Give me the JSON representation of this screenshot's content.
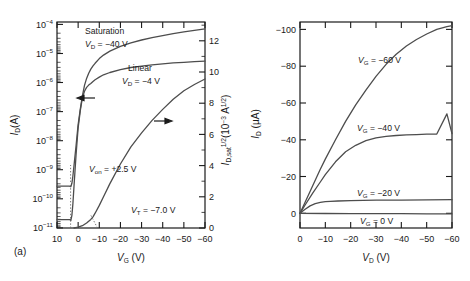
{
  "figure": {
    "panels": [
      {
        "caption": "(a)",
        "type": "transfer-characteristics"
      },
      {
        "caption": "(b)",
        "type": "output-characteristics"
      }
    ]
  },
  "panel_a": {
    "caption": "(a)",
    "xaxis": {
      "title_main": "V",
      "title_sub": "G",
      "title_unit": "(V)",
      "ticks": [
        "10",
        "0",
        "−10",
        "−20",
        "−30",
        "−40",
        "−50",
        "−60"
      ],
      "values": [
        10,
        0,
        -10,
        -20,
        -30,
        -40,
        -50,
        -60
      ],
      "range": [
        10,
        -60
      ]
    },
    "yaxis_left": {
      "title_main": "I",
      "title_sub": "D",
      "title_unit": "(A)",
      "ticks": [
        "10−4",
        "10−5",
        "10−6",
        "10−7",
        "10−8",
        "10−9",
        "10−10",
        "10−11"
      ],
      "tick_bases": [
        "10",
        "10",
        "10",
        "10",
        "10",
        "10",
        "10",
        "10"
      ],
      "tick_exps": [
        "−4",
        "−5",
        "−6",
        "−7",
        "−8",
        "−9",
        "−10",
        "−11"
      ],
      "exponents": [
        -4,
        -5,
        -6,
        -7,
        -8,
        -9,
        -10,
        -11
      ],
      "scale": "log",
      "range": [
        -4,
        -11
      ]
    },
    "yaxis_right": {
      "title_main": "I",
      "title_sub": "D,sat",
      "title_exp": "1/2",
      "title_unit_base": "(10",
      "title_unit_exp": "−3",
      "title_unit_mid": " A",
      "title_unit_exp2": "1/2",
      "title_unit_close": ")",
      "ticks": [
        "0",
        "2",
        "4",
        "6",
        "8",
        "10",
        "12"
      ],
      "values": [
        0,
        2,
        4,
        6,
        8,
        10,
        12
      ],
      "range": [
        0,
        13.2
      ]
    },
    "annotations": [
      {
        "name": "saturation-label",
        "line1": "Saturation",
        "sym": "V",
        "sub": "D",
        "eq": " = −40 V"
      },
      {
        "name": "linear-label",
        "line1": "Linear",
        "sym": "V",
        "sub": "D",
        "eq": " = −4 V"
      },
      {
        "name": "von-label",
        "sym": "V",
        "sub": "on",
        "eq": " = +2.5 V"
      },
      {
        "name": "vt-label",
        "sym": "V",
        "sub": "T",
        "eq": " = −7.0 V"
      }
    ],
    "arrows": [
      {
        "name": "left-axis-arrow",
        "direction": "left"
      },
      {
        "name": "right-axis-arrow",
        "direction": "right"
      }
    ]
  },
  "panel_b": {
    "caption": "(b)",
    "xaxis": {
      "title_main": "V",
      "title_sub": "D",
      "title_unit": "(V)",
      "ticks": [
        "0",
        "−10",
        "−20",
        "−30",
        "−40",
        "−50",
        "−60"
      ],
      "values": [
        0,
        -10,
        -20,
        -30,
        -40,
        -50,
        -60
      ],
      "range": [
        0,
        -60
      ]
    },
    "yaxis": {
      "title_main": "I",
      "title_sub": "D",
      "title_unit": "(μA)",
      "ticks": [
        "0",
        "−20",
        "−40",
        "−60",
        "−80",
        "−100"
      ],
      "values": [
        0,
        -20,
        -40,
        -60,
        -80,
        -100
      ],
      "range": [
        4,
        -108
      ]
    },
    "curve_labels": [
      {
        "name": "vg-60-label",
        "sym": "V",
        "sub": "G",
        "eq": " = −60 V"
      },
      {
        "name": "vg-40-label",
        "sym": "V",
        "sub": "G",
        "eq": " = −40 V"
      },
      {
        "name": "vg-20-label",
        "sym": "V",
        "sub": "G",
        "eq": " = −20 V"
      },
      {
        "name": "vg-0-label",
        "sym": "V",
        "sub": "G",
        "eq": " = 0 V"
      }
    ]
  },
  "colors": {
    "curve": "#4d4d4d",
    "axis": "#1a1a1a",
    "background": "#ffffff",
    "text": "#1a1a1a"
  },
  "chart_data": [
    {
      "type": "line",
      "panel": "(a)",
      "title": "Transfer characteristics",
      "xlabel": "V_G (V)",
      "ylabel": "I_D (A)",
      "ylabel_right": "I_D,sat^1/2 (10^-3 A^1/2)",
      "xlim": [
        10,
        -60
      ],
      "ylim_log": [
        -11,
        -4
      ],
      "ylim_right": [
        0,
        13.2
      ],
      "grid": false,
      "legend": "inline-annotations",
      "series": [
        {
          "name": "Saturation  V_D = -40 V",
          "axis": "left-log",
          "x": [
            10,
            6,
            4,
            3.5,
            3,
            2.5,
            2,
            1,
            0,
            -1,
            -2,
            -3,
            -4,
            -5,
            -6,
            -7,
            -8,
            -10,
            -12,
            -15,
            -20,
            -25,
            -30,
            -35,
            -40,
            -45,
            -50,
            -55,
            -60
          ],
          "y_log10": [
            -9.6,
            -9.6,
            -9.6,
            -9.62,
            -9.5,
            -9.25,
            -8.9,
            -8.2,
            -7.5,
            -6.95,
            -6.5,
            -6.15,
            -5.9,
            -5.72,
            -5.58,
            -5.47,
            -5.38,
            -5.22,
            -5.1,
            -4.96,
            -4.8,
            -4.68,
            -4.58,
            -4.5,
            -4.43,
            -4.36,
            -4.3,
            -4.25,
            -4.2
          ]
        },
        {
          "name": "Linear  V_D = -4 V",
          "axis": "left-log",
          "x": [
            10,
            6,
            4,
            3.5,
            3,
            2.5,
            2,
            1,
            0,
            -1,
            -2,
            -3,
            -4,
            -5,
            -6,
            -7,
            -8,
            -10,
            -12,
            -15,
            -20,
            -25,
            -30,
            -35,
            -40,
            -45,
            -50,
            -55,
            -60
          ],
          "y_log10": [
            -10.75,
            -10.75,
            -10.75,
            -10.78,
            -10.6,
            -10.2,
            -9.6,
            -8.5,
            -7.6,
            -7.0,
            -6.55,
            -6.2,
            -5.98,
            -5.85,
            -5.76,
            -5.68,
            -5.62,
            -5.53,
            -5.45,
            -5.37,
            -5.27,
            -5.2,
            -5.15,
            -5.11,
            -5.07,
            -5.04,
            -5.02,
            -5.0,
            -4.98
          ]
        },
        {
          "name": "sqrt(I_D,sat)",
          "axis": "right-linear",
          "x": [
            2,
            0,
            -2,
            -4,
            -6,
            -7,
            -8,
            -10,
            -12,
            -15,
            -20,
            -25,
            -30,
            -35,
            -40,
            -45,
            -50,
            -55,
            -60
          ],
          "y": [
            0.0,
            0.05,
            0.15,
            0.32,
            0.55,
            0.72,
            0.95,
            1.45,
            2.0,
            2.85,
            4.1,
            5.2,
            6.1,
            6.9,
            7.6,
            8.25,
            8.8,
            9.2,
            9.55
          ]
        }
      ],
      "annotations": [
        "Saturation V_D = -40 V",
        "Linear V_D = -4 V",
        "V_on = +2.5 V",
        "V_T = -7.0 V"
      ]
    },
    {
      "type": "line",
      "panel": "(b)",
      "title": "Output characteristics",
      "xlabel": "V_D (V)",
      "ylabel": "I_D (μA)",
      "xlim": [
        0,
        -60
      ],
      "ylim": [
        4,
        -108
      ],
      "grid": false,
      "legend": "inline-annotations",
      "series": [
        {
          "name": "V_G = -60 V",
          "x": [
            0,
            -2,
            -5,
            -8,
            -10,
            -14,
            -18,
            -22,
            -26,
            -30,
            -34,
            -38,
            -42,
            -46,
            -50,
            -54,
            -58,
            -60
          ],
          "y": [
            0,
            -6,
            -15,
            -24,
            -29.5,
            -40,
            -50,
            -59,
            -67,
            -74.5,
            -81,
            -86.5,
            -91,
            -94.5,
            -97.5,
            -100,
            -101.5,
            -102
          ]
        },
        {
          "name": "V_G = -40 V",
          "x": [
            0,
            -2,
            -5,
            -8,
            -10,
            -14,
            -18,
            -22,
            -26,
            -30,
            -34,
            -38,
            -42,
            -46,
            -50,
            -54,
            -58,
            -60
          ],
          "y": [
            0,
            -4.5,
            -11,
            -17,
            -21,
            -28,
            -33.5,
            -37,
            -39.5,
            -41,
            -41.8,
            -42.3,
            -42.6,
            -42.8,
            -43,
            -43.1,
            -43.2,
            -43.3
          ]
        },
        {
          "name": "V_G = -20 V",
          "x": [
            0,
            -2,
            -4,
            -6,
            -8,
            -10,
            -12,
            -15,
            -20,
            -25,
            -30,
            -40,
            -50,
            -60
          ],
          "y": [
            0,
            -2.2,
            -4.0,
            -5.2,
            -5.9,
            -6.3,
            -6.5,
            -6.7,
            -6.9,
            -7.0,
            -7.1,
            -7.2,
            -7.3,
            -7.4
          ]
        },
        {
          "name": "V_G = 0 V",
          "x": [
            0,
            -10,
            -20,
            -30,
            -40,
            -50,
            -60
          ],
          "y": [
            0,
            -0.1,
            -0.15,
            -0.2,
            -0.2,
            -0.25,
            -0.25
          ]
        }
      ]
    }
  ]
}
